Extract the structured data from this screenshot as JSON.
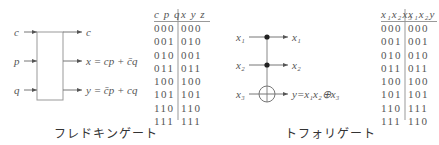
{
  "fredkin": {
    "caption": "フレドキンゲート",
    "inputs": [
      "c",
      "p",
      "q"
    ],
    "outputs": [
      "c",
      "x = cp + c̄q",
      "y = c̄p + cq"
    ],
    "table": {
      "header_in": "c p q",
      "header_out": "x y z",
      "rows": [
        {
          "in": "000",
          "out": "000"
        },
        {
          "in": "001",
          "out": "010"
        },
        {
          "in": "010",
          "out": "001"
        },
        {
          "in": "011",
          "out": "011"
        },
        {
          "in": "100",
          "out": "100"
        },
        {
          "in": "101",
          "out": "101"
        },
        {
          "in": "110",
          "out": "110"
        },
        {
          "in": "111",
          "out": "111"
        }
      ]
    }
  },
  "toffoli": {
    "caption": "トフォリゲート",
    "inputs": [
      "x₁",
      "x₂",
      "x₃"
    ],
    "outputs": [
      "x₁",
      "x₂",
      "y=x₁x₂⊕x₃"
    ],
    "table": {
      "header_in": "x₁x₂x₃",
      "header_out": "x₁x₂y",
      "rows": [
        {
          "in": "000",
          "out": "000"
        },
        {
          "in": "001",
          "out": "001"
        },
        {
          "in": "010",
          "out": "010"
        },
        {
          "in": "011",
          "out": "011"
        },
        {
          "in": "100",
          "out": "100"
        },
        {
          "in": "101",
          "out": "101"
        },
        {
          "in": "110",
          "out": "111"
        },
        {
          "in": "111",
          "out": "110"
        }
      ]
    }
  },
  "colors": {
    "line": "#888888",
    "text": "#555555",
    "dot": "#222222"
  }
}
